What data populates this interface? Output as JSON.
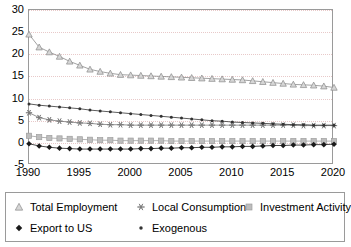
{
  "chart_data": {
    "type": "line",
    "title": "",
    "xlabel": "",
    "ylabel": "",
    "xlim": [
      1990,
      2020
    ],
    "ylim": [
      -5,
      30
    ],
    "grid": true,
    "legend_position": "bottom",
    "x": [
      1990,
      1991,
      1992,
      1993,
      1994,
      1995,
      1996,
      1997,
      1998,
      1999,
      2000,
      2001,
      2002,
      2003,
      2004,
      2005,
      2006,
      2007,
      2008,
      2009,
      2010,
      2011,
      2012,
      2013,
      2014,
      2015,
      2016,
      2017,
      2018,
      2019,
      2020
    ],
    "xticks": [
      "1990",
      "1995",
      "2000",
      "2005",
      "2010",
      "2015",
      "2020"
    ],
    "xtick_values": [
      1990,
      1995,
      2000,
      2005,
      2010,
      2015,
      2020
    ],
    "yticks": [
      "-5",
      "0",
      "5",
      "10",
      "15",
      "20",
      "25",
      "30"
    ],
    "ytick_values": [
      -5,
      0,
      5,
      10,
      15,
      20,
      25,
      30
    ],
    "series": [
      {
        "name": "Total Employment",
        "marker": "triangle",
        "color": "#8a8a8a",
        "values": [
          24.5,
          21.6,
          20.5,
          19.5,
          18.4,
          17.5,
          16.6,
          16.1,
          15.7,
          15.4,
          15.3,
          15.2,
          15.1,
          15.0,
          14.9,
          14.8,
          14.7,
          14.6,
          14.5,
          14.4,
          14.3,
          14.2,
          14.0,
          13.8,
          13.6,
          13.4,
          13.2,
          13.1,
          13.0,
          12.8,
          12.5
        ]
      },
      {
        "name": "Local Consumption",
        "marker": "asterisk",
        "color": "#7a7a7a",
        "values": [
          6.8,
          5.7,
          5.2,
          4.9,
          4.7,
          4.5,
          4.4,
          4.2,
          4.1,
          4.1,
          4.0,
          4.0,
          4.0,
          4.0,
          4.0,
          4.0,
          4.0,
          4.0,
          4.0,
          4.0,
          4.0,
          4.0,
          4.0,
          4.0,
          4.0,
          4.0,
          4.0,
          3.9,
          3.9,
          3.9,
          3.9
        ]
      },
      {
        "name": "Investment Activity",
        "marker": "square",
        "color": "#9e9e9e",
        "values": [
          1.6,
          1.3,
          1.1,
          1.0,
          0.9,
          0.8,
          0.7,
          0.6,
          0.6,
          0.5,
          0.5,
          0.5,
          0.5,
          0.5,
          0.4,
          0.4,
          0.4,
          0.4,
          0.4,
          0.4,
          0.4,
          0.4,
          0.4,
          0.4,
          0.4,
          0.4,
          0.4,
          0.4,
          0.4,
          0.4,
          0.4
        ]
      },
      {
        "name": "Export to US",
        "marker": "diamond",
        "color": "#1a1a1a",
        "values": [
          -0.2,
          -0.7,
          -1.0,
          -1.2,
          -1.3,
          -1.4,
          -1.4,
          -1.4,
          -1.4,
          -1.4,
          -1.4,
          -1.3,
          -1.3,
          -1.2,
          -1.2,
          -1.1,
          -1.1,
          -1.0,
          -1.0,
          -0.9,
          -0.9,
          -0.8,
          -0.8,
          -0.7,
          -0.6,
          -0.6,
          -0.5,
          -0.5,
          -0.4,
          -0.4,
          -0.3
        ]
      },
      {
        "name": "Exogenous",
        "marker": "dot",
        "color": "#333333",
        "values": [
          8.8,
          8.5,
          8.3,
          8.1,
          7.9,
          7.7,
          7.4,
          7.2,
          7.0,
          6.8,
          6.6,
          6.4,
          6.2,
          6.0,
          5.8,
          5.6,
          5.4,
          5.2,
          5.0,
          4.9,
          4.7,
          4.6,
          4.5,
          4.4,
          4.3,
          4.2,
          4.1,
          4.1,
          4.0,
          4.0,
          4.0
        ]
      }
    ]
  },
  "legend": {
    "items": [
      {
        "label": "Total Employment",
        "marker": "triangle",
        "row": 0,
        "col": 0
      },
      {
        "label": "Local Consumption",
        "marker": "asterisk",
        "row": 0,
        "col": 1
      },
      {
        "label": "Investment Activity",
        "marker": "square",
        "row": 0,
        "col": 2
      },
      {
        "label": "Export to US",
        "marker": "diamond",
        "row": 1,
        "col": 0
      },
      {
        "label": "Exogenous",
        "marker": "dot",
        "row": 1,
        "col": 1
      }
    ]
  },
  "colors": {
    "axis": "#9a9a9a",
    "grid": "#e8c9c9",
    "text": "#000000",
    "background": "#ffffff"
  }
}
